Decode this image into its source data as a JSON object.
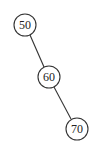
{
  "diagram": {
    "type": "binary-search-tree",
    "nodes": [
      {
        "id": "n50",
        "label": "50",
        "cx": 25,
        "cy": 25,
        "r": 11
      },
      {
        "id": "n60",
        "label": "60",
        "cx": 49,
        "cy": 77,
        "r": 11
      },
      {
        "id": "n70",
        "label": "70",
        "cx": 77,
        "cy": 129,
        "r": 11
      }
    ],
    "edges": [
      {
        "from": "n50",
        "to": "n60",
        "side": "right"
      },
      {
        "from": "n60",
        "to": "n70",
        "side": "right"
      }
    ],
    "colors": {
      "stroke": "#333333",
      "text": "#222222",
      "background": "#ffffff"
    }
  }
}
